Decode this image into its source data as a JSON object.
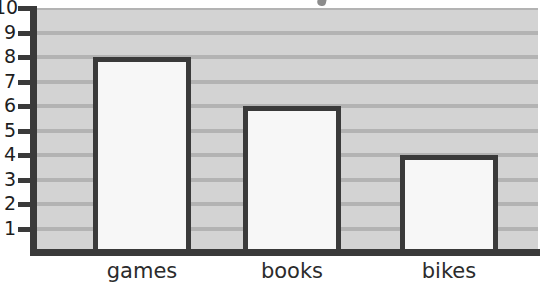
{
  "chart_data": {
    "type": "bar",
    "title": "",
    "subtitle": "",
    "xlabel": "",
    "ylabel": "",
    "categories": [
      "games",
      "books",
      "bikes"
    ],
    "values": [
      8,
      6,
      4
    ],
    "series": [
      {
        "name": "",
        "values": [
          8,
          6,
          4
        ]
      }
    ],
    "ylim": [
      0,
      10
    ],
    "ytick_labels": [
      "1",
      "2",
      "3",
      "4",
      "5",
      "6",
      "7",
      "8",
      "9",
      "10"
    ],
    "ytick_values": [
      1,
      2,
      3,
      4,
      5,
      6,
      7,
      8,
      9,
      10
    ],
    "grid": true,
    "grid_orientation": "horizontal",
    "legend": false,
    "legend_position": "none",
    "annotations": [],
    "colors": {
      "bar_fill": "#f7f7f7",
      "bar_border": "#3a3a3a",
      "plot_background": "#d3d3d3",
      "gridline": "#b3b3b3",
      "axis": "#3a3a3a",
      "label_text": "#2b2b2b",
      "tick_text": "#1e1e1e",
      "page_background": "#ffffff"
    }
  }
}
